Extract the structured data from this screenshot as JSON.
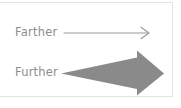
{
  "card": {
    "background_color": "#ffffff",
    "border_color": "#e2e2e2"
  },
  "diagram": {
    "type": "comparison-illustration",
    "text_color": "#8d8d8d",
    "arrow_fill_color": "#8a8a8a",
    "thin_arrow_stroke_color": "#9a9a9a",
    "rows": [
      {
        "id": "farther",
        "label": "Farther",
        "arrow_name": "thin-line-arrow",
        "arrow_style": "thin open-head line arrow",
        "direction": "right"
      },
      {
        "id": "further",
        "label": "Further",
        "arrow_name": "tapered-block-arrow",
        "arrow_style": "large filled tapering block arrow",
        "direction": "right"
      }
    ]
  }
}
